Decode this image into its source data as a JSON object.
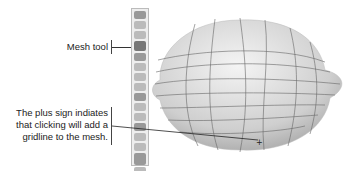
{
  "callouts": {
    "mesh_tool": "Mesh tool",
    "plus_sign_line1": "The plus sign indiates",
    "plus_sign_line2": "that clicking will add a",
    "plus_sign_line3": "gridline to the mesh."
  },
  "toolbar": {
    "tools": [
      "selection-tool",
      "direct-selection-tool",
      "magic-wand-tool",
      "mesh-tool",
      "gradient-tool",
      "eyedropper-tool",
      "blend-tool",
      "symbol-sprayer-tool",
      "column-graph-tool",
      "slice-tool",
      "scissors-tool",
      "hand-tool",
      "zoom-tool",
      "fill-stroke-swap",
      "fill-stroke-swatches",
      "screen-mode"
    ],
    "active": "mesh-tool"
  },
  "cursor": {
    "icon": "mesh-add-cursor",
    "symbol": "+"
  }
}
